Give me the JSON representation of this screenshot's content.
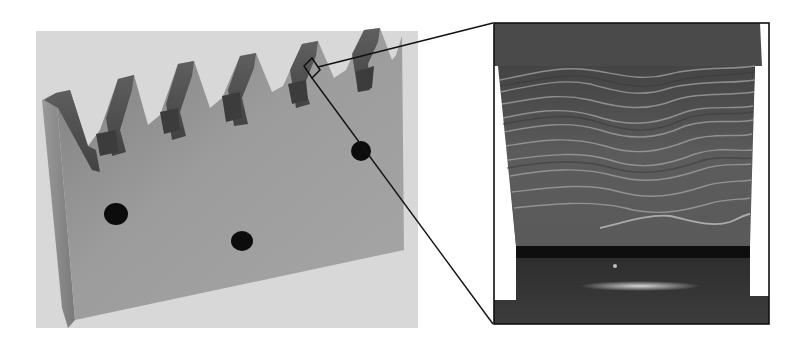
{
  "figure": {
    "panels": [
      {
        "id": "specimen-photo",
        "subject": "gear rack specimen",
        "tooth_count": 6,
        "marker_dot_count": 3,
        "background_color": "#d9d9d9"
      },
      {
        "id": "magnified-inset",
        "subject": "close-up of tooth flank showing wavy layered striations",
        "border_color": "#111111"
      }
    ],
    "callout": {
      "from": "tooth-5-region",
      "to": "magnified-inset",
      "line_color": "#111111"
    },
    "colors": {
      "photo_bg": "#d8d8d8",
      "metal_face": "#8f8f8f",
      "metal_face_light": "#a9a9a9",
      "tooth_shadow": "#4a4a4a",
      "dot": "#0c0c0c",
      "inset_dark": "#3d3d3d",
      "inset_mid": "#666666",
      "stripe": "#a5a5a5"
    }
  }
}
